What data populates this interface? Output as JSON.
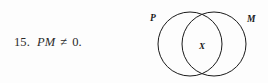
{
  "page": {
    "background_color": "#fdfdfd",
    "ink_color": "#1d1d1d"
  },
  "exercise": {
    "number": "15.",
    "expression": {
      "left_operand": "PM",
      "relation": "≠",
      "right_operand": "0."
    }
  },
  "diagram": {
    "type": "venn-two-set",
    "stroke_color": "#1a1a1a",
    "fill": "none",
    "sets": [
      {
        "id": "set-p",
        "label": "P",
        "label_position": "upper-left"
      },
      {
        "id": "set-m",
        "label": "M",
        "label_position": "upper-right"
      }
    ],
    "region_labels": [
      {
        "id": "intersection",
        "label": "X",
        "position": "center-overlap"
      }
    ]
  }
}
